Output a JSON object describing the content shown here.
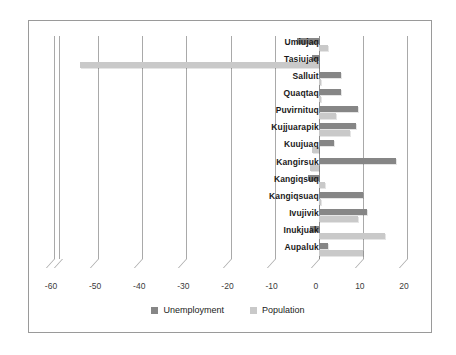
{
  "chart_data": {
    "type": "bar",
    "orientation": "horizontal",
    "title": "",
    "subtitle": "",
    "xlabel": "",
    "ylabel": "",
    "xlim": [
      -60,
      20
    ],
    "xticks": [
      -60,
      -50,
      -40,
      -30,
      -20,
      -10,
      0,
      10,
      20
    ],
    "xtick_labels": [
      "-60",
      "-50",
      "-40",
      "-30",
      "-20",
      "-10",
      "0",
      "10",
      "20"
    ],
    "grid": true,
    "legend_position": "bottom",
    "categories": [
      "Umiujaq",
      "Tasiujaq",
      "Salluit",
      "Quaqtaq",
      "Puvirnituq",
      "Kujjuarapik",
      "Kuujuaq",
      "Kangirsuk",
      "Kangiqsuq",
      "Kangiqsuaq",
      "Ivujivik",
      "Inukjuak",
      "Aupaluk"
    ],
    "series": [
      {
        "name": "Unemployment",
        "color": "#868686",
        "values": [
          -5.0,
          -1.5,
          5.0,
          5.0,
          9.0,
          8.5,
          3.5,
          17.5,
          -2.5,
          10.0,
          11.0,
          -2.0,
          2.0
        ]
      },
      {
        "name": "Population",
        "color": "#c9c9c9",
        "values": [
          2.0,
          -54.0,
          0.5,
          0.5,
          4.0,
          7.0,
          -1.5,
          -2.0,
          1.5,
          0.5,
          9.0,
          15.0,
          10.0
        ]
      }
    ]
  },
  "legend": {
    "items": [
      {
        "label": "Unemployment",
        "color": "#868686"
      },
      {
        "label": "Population",
        "color": "#c9c9c9"
      }
    ]
  },
  "colors": {
    "unemployment": "#868686",
    "population": "#c9c9c9",
    "gridline": "#a9a9a9",
    "frame": "#9a9a9a",
    "background": "#ffffff",
    "label_text": "#1a1a1a",
    "tick_text": "#3b3b3b"
  }
}
